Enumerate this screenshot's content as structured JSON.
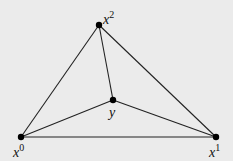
{
  "diagram": {
    "type": "triangle-subdivision",
    "background": "#ebebeb",
    "stroke_color": "#222222",
    "points": [
      {
        "id": "x0",
        "base": "x",
        "sup": "0",
        "x": 21,
        "y": 137,
        "label_x": 13,
        "label_y": 143
      },
      {
        "id": "x1",
        "base": "x",
        "sup": "1",
        "x": 216,
        "y": 137,
        "label_x": 209,
        "label_y": 143
      },
      {
        "id": "x2",
        "base": "x",
        "sup": "2",
        "x": 99,
        "y": 25,
        "label_x": 103,
        "label_y": 10
      },
      {
        "id": "y",
        "base": "y",
        "sup": "",
        "x": 113,
        "y": 100,
        "label_x": 109,
        "label_y": 106
      }
    ],
    "edges": [
      [
        "x0",
        "x1"
      ],
      [
        "x0",
        "x2"
      ],
      [
        "x1",
        "x2"
      ],
      [
        "x0",
        "y"
      ],
      [
        "x1",
        "y"
      ],
      [
        "x2",
        "y"
      ]
    ]
  }
}
